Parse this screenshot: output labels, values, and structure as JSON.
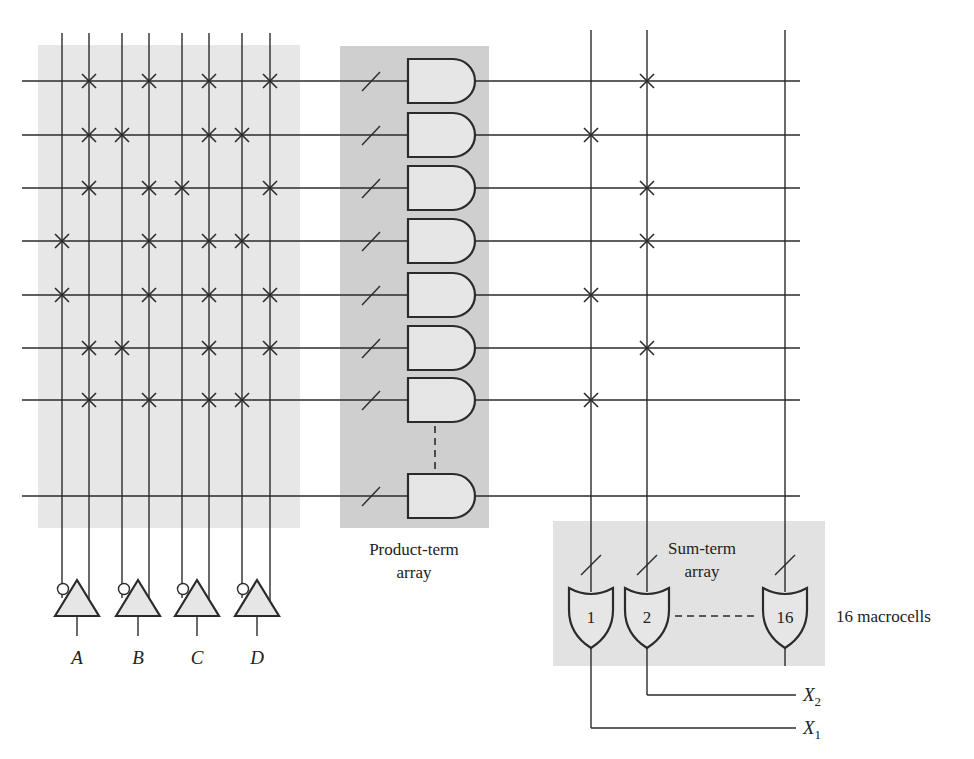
{
  "diagram": {
    "colors": {
      "line": "#2b2b2b",
      "input_shade": "#e7e7e7",
      "product_shade": "#cfcfcf",
      "sum_shade": "#e2e2e2",
      "gate_fill": "#e6e6e6"
    },
    "inputs": [
      {
        "name": "A"
      },
      {
        "name": "B"
      },
      {
        "name": "C"
      },
      {
        "name": "D"
      }
    ],
    "input_columns_x": [
      62,
      89,
      122,
      149,
      182,
      209,
      242,
      270
    ],
    "rows_y": [
      81,
      135,
      188,
      241,
      295,
      348,
      400,
      496
    ],
    "and_connections": [
      [
        1,
        3,
        5,
        7
      ],
      [
        1,
        2,
        5,
        6
      ],
      [
        1,
        3,
        4,
        7
      ],
      [
        0,
        3,
        5,
        6
      ],
      [
        0,
        3,
        5,
        7
      ],
      [
        1,
        2,
        5,
        7
      ],
      [
        1,
        3,
        5,
        6
      ],
      []
    ],
    "sum_columns_x": [
      591,
      647,
      785
    ],
    "or_connections": [
      [
        1
      ],
      [
        0
      ],
      [
        1
      ],
      [
        1
      ],
      [
        0
      ],
      [
        1
      ],
      [
        0
      ],
      []
    ],
    "product_label_line1": "Product-term",
    "product_label_line2": "array",
    "sum_label_line1": "Sum-term",
    "sum_label_line2": "array",
    "or_gates": [
      {
        "label": "1"
      },
      {
        "label": "2"
      },
      {
        "label": "16"
      }
    ],
    "macrocells_label": "16 macrocells",
    "outputs": [
      {
        "name": "X",
        "sub": "2"
      },
      {
        "name": "X",
        "sub": "1"
      }
    ]
  }
}
